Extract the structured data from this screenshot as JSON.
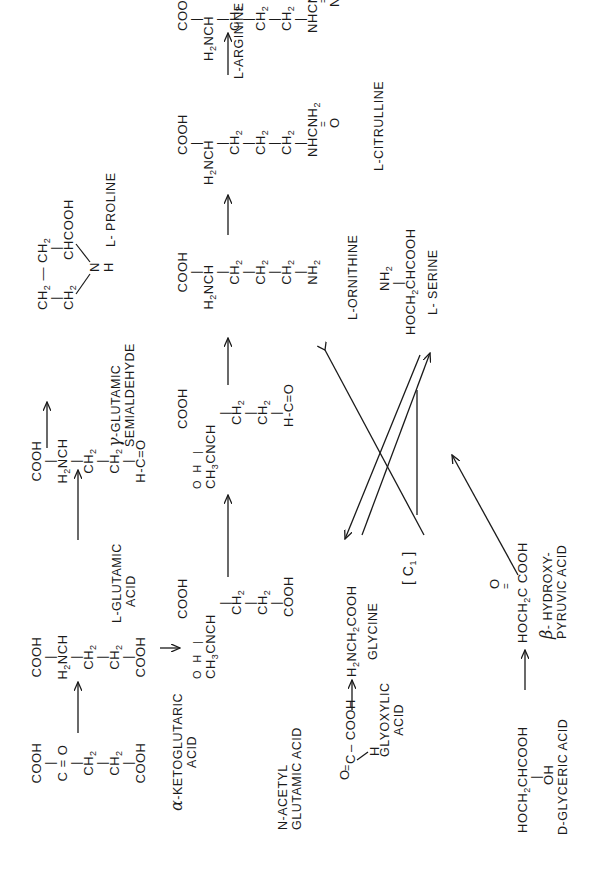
{
  "diagram": {
    "type": "metabolic-pathway",
    "orientation": "rotated 90deg counter-clockwise",
    "compounds": {
      "alpha_ketoglutaric": {
        "label_line1": "-KETOGLUTARIC",
        "label_greek": "α",
        "label_line2": "ACID",
        "lines": [
          "COOH",
          "|",
          "C = O",
          "|",
          "CH2",
          "|",
          "CH2",
          "|",
          "COOH"
        ]
      },
      "l_glutamic": {
        "label_line1": "L-GLUTAMIC",
        "label_line2": "ACID",
        "lines": [
          "COOH",
          "|",
          "H2NCH",
          "|",
          "CH2",
          "|",
          "CH2",
          "|",
          "COOH"
        ]
      },
      "glutamic_semialdehyde": {
        "label_greek": "γ",
        "label_line1": "-GLUTAMIC",
        "label_line2": "SEMIALDEHYDE",
        "lines": [
          "COOH",
          "|",
          "H2NCH",
          "|",
          "CH2",
          "|",
          "CH2",
          "|",
          "H-C=O"
        ]
      },
      "l_proline": {
        "label": "L- PROLINE",
        "lines": [
          "CH2 — CH2",
          "CH2   CHCOOH",
          "N",
          "H"
        ]
      },
      "n_acetyl_glutamic": {
        "label_line1": "N-ACETYL",
        "label_line2": "GLUTAMIC  ACID",
        "lines": [
          "COOH",
          "O  H |",
          "CH3CNCH",
          "|",
          "CH2",
          "|",
          "CH2",
          "|",
          "COOH"
        ]
      },
      "n_acetyl_glutamic_semialdehyde": {
        "lines": [
          "COOH",
          "O  H |",
          "CH3CNCH",
          "|",
          "CH2",
          "|",
          "CH2",
          "|",
          "H-C=O"
        ]
      },
      "l_ornithine": {
        "label": "L-ORNITHINE",
        "lines": [
          "COOH",
          "|",
          "H2NCH",
          "|",
          "CH2",
          "|",
          "CH2",
          "|",
          "CH2",
          "|",
          "NH2"
        ]
      },
      "l_citrulline": {
        "label": "L-CITRULLINE",
        "lines": [
          "COOH",
          "|",
          "H2NCH",
          "|",
          "CH2",
          "|",
          "CH2",
          "|",
          "CH2",
          "|",
          "NHCNH2",
          "O"
        ]
      },
      "l_arginine": {
        "label": "L-ARGININE",
        "lines": [
          "COOH",
          "|",
          "H2NCH",
          "|",
          "CH2",
          "|",
          "CH2",
          "|",
          "CH2",
          "|",
          "NHCNH2",
          "NH"
        ]
      },
      "glyoxylic": {
        "label_line1": "GLYOXYLIC",
        "label_line2": "ACID",
        "formula": "O=C(H)-COOH"
      },
      "glycine": {
        "label": "GLYCINE",
        "formula": "H2NCH2COOH"
      },
      "c1_unit": {
        "label": "[ C1 ]"
      },
      "l_serine": {
        "label": "L- SERINE",
        "formula_top": "NH2",
        "formula": "HOCH2CHCOOH"
      },
      "d_glyceric": {
        "label": "D-GLYCERIC ACID",
        "formula": "HOCH2CHCOOH",
        "formula_sub": "OH"
      },
      "beta_hydroxypyruvic": {
        "label_greek": "β",
        "label_line1": "- HYDROXY-",
        "label_line2": "PYRUVIC ACID",
        "formula": "HOCH2C COOH",
        "formula_top": "O"
      }
    },
    "text": {
      "COOH": "COOH",
      "C_eq_O": "C = O",
      "CH2": "CH",
      "H2NCH": "NCH",
      "H": "H",
      "N": "N",
      "O": "O",
      "C": "C",
      "NH": "NH",
      "NH2": "NH",
      "two": "2",
      "three": "3",
      "one": "1",
      "bar": "|",
      "COOH_dash": "– COOH",
      "HOCH": "HOCH",
      "CHCOOH": "CHCOOH",
      "C_COOH": "C COOH",
      "NHCNH": "NHCNH",
      "NHC": "NHC",
      "CNCH": "CNCH",
      "CH3": "CH",
      "NCH2COOH": "NCH",
      "COOH2": "COOH",
      "OH": "OH",
      "arrow": "→"
    },
    "colors": {
      "ink": "#1a1a1a",
      "paper": "#ffffff"
    }
  }
}
